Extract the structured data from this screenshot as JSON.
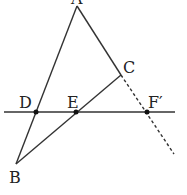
{
  "diagram": {
    "type": "geometry",
    "stroke_color": "#333333",
    "points": {
      "A": {
        "label": "A",
        "x": 77,
        "y": 6
      },
      "B": {
        "label": "B",
        "x": 16,
        "y": 164
      },
      "C": {
        "label": "C",
        "x": 121,
        "y": 75
      },
      "D": {
        "label": "D",
        "x": 36,
        "y": 112
      },
      "E": {
        "label": "E",
        "x": 76,
        "y": 112
      },
      "F": {
        "label": "F′",
        "x": 147,
        "y": 112
      }
    },
    "segments": [
      {
        "from": "A",
        "to": "B",
        "style": "solid"
      },
      {
        "from": "A",
        "to": "C",
        "style": "solid"
      },
      {
        "from": "B",
        "to": "C",
        "style": "solid"
      },
      {
        "from": "C",
        "to": "extend",
        "style": "dashed"
      }
    ],
    "line": {
      "name": "horizontal-line-through-DEF",
      "y": 112,
      "x_start": 4,
      "x_end": 175
    }
  }
}
